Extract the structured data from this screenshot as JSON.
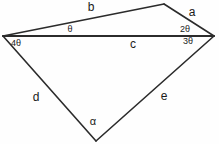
{
  "figure": {
    "background_color": "#fefefe",
    "stroke_color": "#2b2b2b",
    "text_color": "#1a1a1a",
    "width": 219,
    "height": 144,
    "type": "geometry-diagram"
  },
  "vertices": [
    {
      "name": "left",
      "x": 3,
      "y": 36
    },
    {
      "name": "top",
      "x": 164,
      "y": 4
    },
    {
      "name": "right",
      "x": 214,
      "y": 36
    },
    {
      "name": "bottom",
      "x": 96,
      "y": 141
    }
  ],
  "edges": [
    {
      "name": "b",
      "from": "left",
      "to": "top",
      "x1": 3,
      "y1": 36,
      "x2": 164,
      "y2": 4,
      "width": 1.6
    },
    {
      "name": "a",
      "from": "top",
      "to": "right",
      "x1": 164,
      "y1": 4,
      "x2": 214,
      "y2": 36,
      "width": 1.6
    },
    {
      "name": "c",
      "from": "left",
      "to": "right",
      "x1": 3,
      "y1": 36,
      "x2": 214,
      "y2": 36,
      "width": 2.0
    },
    {
      "name": "d",
      "from": "left",
      "to": "bottom",
      "x1": 3,
      "y1": 36,
      "x2": 96,
      "y2": 141,
      "width": 1.6
    },
    {
      "name": "e",
      "from": "bottom",
      "to": "right",
      "x1": 96,
      "y1": 141,
      "x2": 214,
      "y2": 36,
      "width": 1.6
    }
  ],
  "side_labels": [
    {
      "id": "b",
      "text": "b",
      "x": 91,
      "y": 7
    },
    {
      "id": "a",
      "text": "a",
      "x": 192,
      "y": 12
    },
    {
      "id": "c",
      "text": "c",
      "x": 133,
      "y": 44
    },
    {
      "id": "d",
      "text": "d",
      "x": 36,
      "y": 97
    },
    {
      "id": "e",
      "text": "e",
      "x": 164,
      "y": 96
    }
  ],
  "angle_labels": [
    {
      "id": "theta",
      "text": "θ",
      "x": 70,
      "y": 29
    },
    {
      "id": "two-theta",
      "text": "2θ",
      "x": 185,
      "y": 29
    },
    {
      "id": "three-theta",
      "text": "3θ",
      "x": 188,
      "y": 41
    },
    {
      "id": "four-theta",
      "text": "4θ",
      "x": 16,
      "y": 43
    },
    {
      "id": "alpha",
      "text": "α",
      "x": 93,
      "y": 121
    }
  ]
}
